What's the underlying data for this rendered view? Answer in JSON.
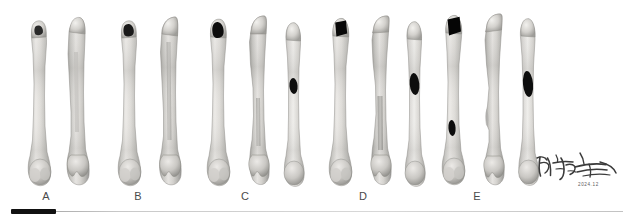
{
  "figure": {
    "type": "specimen-photo-panel",
    "background_color": "#ffffff",
    "bone_color_light": "#e8e7e4",
    "bone_color_mid": "#c9c8c4",
    "bone_color_shadow": "#9d9c98",
    "defect_color": "#111111"
  },
  "groups": [
    {
      "id": "A",
      "label": "A",
      "label_x": 46,
      "specimen_count": 2,
      "specimens": [
        {
          "name": "A1",
          "view": "anterior",
          "x": 24,
          "width": 30,
          "height": 172,
          "defect": {
            "present": true,
            "site": "proximal",
            "shape": "irregular-notch",
            "width": 9,
            "height": 8,
            "fill": "#2a2a2a"
          }
        },
        {
          "name": "A2",
          "view": "posterior",
          "x": 60,
          "width": 32,
          "height": 174,
          "defect": {
            "present": false
          }
        }
      ]
    },
    {
      "id": "B",
      "label": "B",
      "label_x": 138,
      "specimen_count": 2,
      "specimens": [
        {
          "name": "B1",
          "view": "anterior",
          "x": 114,
          "width": 30,
          "height": 172,
          "defect": {
            "present": true,
            "site": "proximal",
            "shape": "irregular-oval",
            "width": 11,
            "height": 10,
            "fill": "#1a1a1a"
          }
        },
        {
          "name": "B2",
          "view": "posterior",
          "x": 152,
          "width": 32,
          "height": 174,
          "defect": {
            "present": false
          }
        }
      ]
    },
    {
      "id": "C",
      "label": "C",
      "label_x": 245,
      "specimen_count": 3,
      "specimens": [
        {
          "name": "C1",
          "view": "anterior",
          "x": 203,
          "width": 31,
          "height": 172,
          "defect": {
            "present": true,
            "site": "proximal",
            "shape": "rounded-square",
            "width": 13,
            "height": 13,
            "fill": "#0d0d0d"
          }
        },
        {
          "name": "C2",
          "view": "posterior",
          "x": 240,
          "width": 32,
          "height": 174,
          "defect": {
            "present": false
          }
        },
        {
          "name": "C3",
          "view": "lateral",
          "x": 278,
          "width": 28,
          "height": 168,
          "defect": {
            "present": true,
            "site": "mid-shaft",
            "shape": "oval",
            "width": 8,
            "height": 16,
            "fill": "#0d0d0d"
          }
        }
      ]
    },
    {
      "id": "D",
      "label": "D",
      "label_x": 363,
      "specimen_count": 3,
      "specimens": [
        {
          "name": "D1",
          "view": "anterior",
          "x": 325,
          "width": 31,
          "height": 172,
          "defect": {
            "present": true,
            "site": "proximal",
            "shape": "rectangular",
            "width": 15,
            "height": 16,
            "fill": "#080808"
          }
        },
        {
          "name": "D2",
          "view": "posterior",
          "x": 362,
          "width": 32,
          "height": 174,
          "defect": {
            "present": false
          }
        },
        {
          "name": "D3",
          "view": "lateral",
          "x": 399,
          "width": 28,
          "height": 168,
          "defect": {
            "present": true,
            "site": "mid-shaft",
            "shape": "oval",
            "width": 10,
            "height": 22,
            "fill": "#0d0d0d"
          }
        }
      ]
    },
    {
      "id": "E",
      "label": "E",
      "label_x": 477,
      "specimen_count": 3,
      "specimens": [
        {
          "name": "E1",
          "view": "anterior",
          "x": 438,
          "width": 31,
          "height": 174,
          "defect": {
            "present": true,
            "site": "proximal-and-distal-shaft",
            "shape": "rectangular-plus-oval",
            "width": 16,
            "height": 18,
            "fill": "#050505"
          }
        },
        {
          "name": "E2",
          "view": "posterior",
          "x": 475,
          "width": 32,
          "height": 176,
          "defect": {
            "present": false
          }
        },
        {
          "name": "E3",
          "view": "lateral",
          "x": 512,
          "width": 28,
          "height": 170,
          "defect": {
            "present": true,
            "site": "mid-shaft",
            "shape": "oval",
            "width": 11,
            "height": 26,
            "fill": "#0d0d0d"
          }
        }
      ]
    }
  ],
  "scale_bar": {
    "name": "scale-bar",
    "bar_color": "#111111",
    "bar_left": 11,
    "bar_width": 45,
    "baseline_color": "#c9c9c9",
    "baseline_left": 11,
    "baseline_width": 612,
    "caption": ""
  },
  "signature": {
    "name": "handwritten-signature",
    "script": "Chinese cursive",
    "date_text": "2024.12"
  }
}
